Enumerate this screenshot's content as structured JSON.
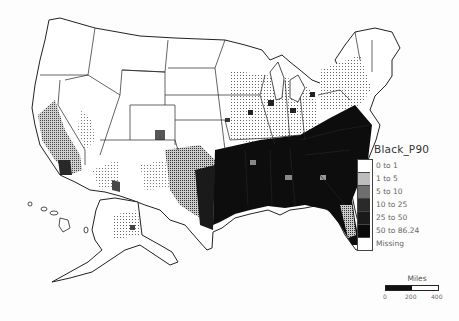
{
  "map": {
    "title": "Black_P90",
    "region": "United States (counties) incl. Alaska and Hawaii",
    "theme": "Black population 1990 by county (percent)",
    "colors": {
      "background": "#fdfdfd",
      "outline": "#222222"
    }
  },
  "legend": {
    "title": "Black_P90",
    "items": [
      {
        "label": "0 to 1",
        "color": "#ffffff"
      },
      {
        "label": "1 to 5",
        "color": "#bdbdbd"
      },
      {
        "label": "5 to 10",
        "color": "#7a7a7a"
      },
      {
        "label": "10 to 25",
        "color": "#2a2a2a"
      },
      {
        "label": "25 to 50",
        "color": "#1a1a1a"
      },
      {
        "label": "50 to 86.24",
        "color": "#0a0a0a"
      },
      {
        "label": "Missing",
        "color": "#ffffff"
      }
    ]
  },
  "scale_bar": {
    "unit": "Miles",
    "ticks": [
      "0",
      "200",
      "400"
    ]
  }
}
